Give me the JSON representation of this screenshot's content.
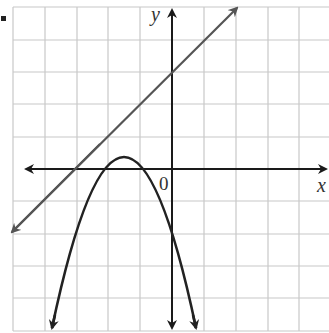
{
  "figure": {
    "bullet": "•",
    "x_axis_label": "x",
    "y_axis_label": "y",
    "origin_label": "0",
    "colors": {
      "grid": "#c8c8c8",
      "axis": "#1a1a1a",
      "line": "#555555",
      "parabola": "#222222"
    },
    "grid": {
      "x_min": -5,
      "x_max": 5,
      "y_min": -5,
      "y_max": 5,
      "unit_px": 32
    },
    "curves": [
      {
        "name": "line",
        "equation": "y = x + 3",
        "type": "line"
      },
      {
        "name": "parabola",
        "equation": "y = -(x+1)(x+2)",
        "type": "parabola",
        "vertex": [
          -1.5,
          0.25
        ],
        "x_intercepts": [
          -2,
          -1
        ],
        "y_intercept": -2
      }
    ]
  }
}
